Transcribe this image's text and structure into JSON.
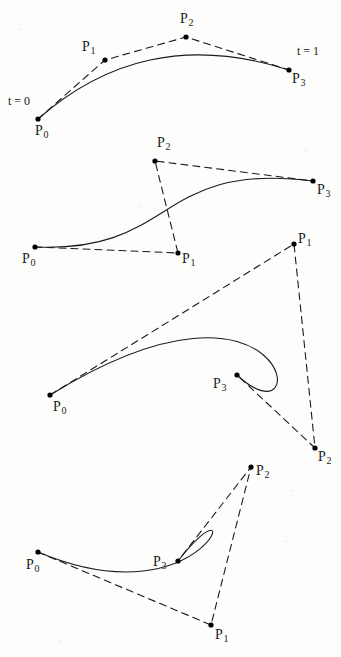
{
  "figure": {
    "background_color": "#fdfdfb",
    "curve_color": "#1a1a1a",
    "polygon_color": "#1a1a1a",
    "point_color": "#000000",
    "curve_width": 1.1,
    "polygon_width": 1.1,
    "polygon_dash": "7,5",
    "point_radius": 2.6
  },
  "chart_data": {
    "type": "line",
    "xlabel": "",
    "ylabel": "",
    "xlim": [
      0,
      341
    ],
    "ylim": [
      657,
      0
    ],
    "grid": false,
    "legend": "none",
    "curve_type": "cubic-bezier",
    "panels": [
      {
        "name": "bezier-curve-1",
        "index": 1,
        "description": "Arch-shaped curve, convex control polygon",
        "control_points": [
          {
            "label": "P0",
            "x": 38,
            "y": 119
          },
          {
            "label": "P1",
            "x": 105,
            "y": 60
          },
          {
            "label": "P2",
            "x": 186,
            "y": 37
          },
          {
            "label": "P3",
            "x": 289,
            "y": 70
          }
        ],
        "annotations": [
          {
            "text": "t = 0",
            "x": 8,
            "y": 95
          },
          {
            "text": "t = 1",
            "x": 297,
            "y": 45
          }
        ],
        "point_labels": [
          {
            "base": "P",
            "sub": "0",
            "x": 35,
            "y": 124
          },
          {
            "base": "P",
            "sub": "1",
            "x": 82,
            "y": 40
          },
          {
            "base": "P",
            "sub": "2",
            "x": 180,
            "y": 12
          },
          {
            "base": "P",
            "sub": "3",
            "x": 292,
            "y": 72
          }
        ]
      },
      {
        "name": "bezier-curve-2",
        "index": 2,
        "description": "S-shaped curve, self-crossing control polygon",
        "control_points": [
          {
            "label": "P0",
            "x": 35,
            "y": 247
          },
          {
            "label": "P1",
            "x": 178,
            "y": 253
          },
          {
            "label": "P2",
            "x": 155,
            "y": 161
          },
          {
            "label": "P3",
            "x": 313,
            "y": 181
          }
        ],
        "annotations": [],
        "point_labels": [
          {
            "base": "P",
            "sub": "0",
            "x": 22,
            "y": 252
          },
          {
            "base": "P",
            "sub": "1",
            "x": 182,
            "y": 252
          },
          {
            "base": "P",
            "sub": "2",
            "x": 157,
            "y": 136
          },
          {
            "base": "P",
            "sub": "3",
            "x": 317,
            "y": 183
          }
        ]
      },
      {
        "name": "bezier-curve-3",
        "index": 3,
        "description": "Looping curve with cusp, control polygon crosses itself",
        "control_points": [
          {
            "label": "P0",
            "x": 50,
            "y": 395
          },
          {
            "label": "P1",
            "x": 294,
            "y": 244
          },
          {
            "label": "P2",
            "x": 315,
            "y": 448
          },
          {
            "label": "P3",
            "x": 237,
            "y": 375
          }
        ],
        "annotations": [],
        "point_labels": [
          {
            "base": "P",
            "sub": "0",
            "x": 53,
            "y": 400
          },
          {
            "base": "P",
            "sub": "1",
            "x": 298,
            "y": 232
          },
          {
            "base": "P",
            "sub": "2",
            "x": 318,
            "y": 450
          },
          {
            "base": "P",
            "sub": "3",
            "x": 213,
            "y": 377
          }
        ]
      },
      {
        "name": "bezier-curve-4",
        "index": 4,
        "description": "Tight loop curve, narrow triangular control polygon",
        "control_points": [
          {
            "label": "P0",
            "x": 38,
            "y": 552
          },
          {
            "label": "P1",
            "x": 211,
            "y": 625
          },
          {
            "label": "P2",
            "x": 251,
            "y": 467
          },
          {
            "label": "P3",
            "x": 178,
            "y": 561
          }
        ],
        "annotations": [],
        "point_labels": [
          {
            "base": "P",
            "sub": "0",
            "x": 26,
            "y": 558
          },
          {
            "base": "P",
            "sub": "1",
            "x": 215,
            "y": 628
          },
          {
            "base": "P",
            "sub": "2",
            "x": 256,
            "y": 464
          },
          {
            "base": "P",
            "sub": "3",
            "x": 153,
            "y": 555
          }
        ]
      }
    ]
  }
}
